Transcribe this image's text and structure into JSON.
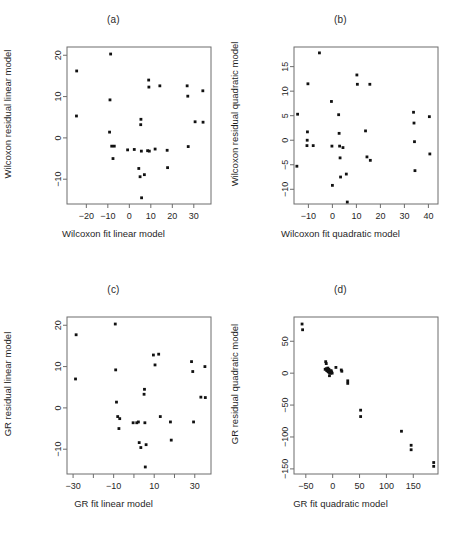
{
  "figure": {
    "background": "#ffffff",
    "point_color": "#111111",
    "axis_color": "#6d6d6d",
    "panel_count": 4
  },
  "chart_data": [
    {
      "type": "scatter",
      "panel": "(a)",
      "title": "",
      "xlabel": "Wilcoxon fit linear model",
      "ylabel": "Wilcoxon residual linear model",
      "xlim": [
        -29,
        38
      ],
      "ylim": [
        -16,
        22
      ],
      "xticks": [
        -20,
        -10,
        0,
        10,
        20,
        30
      ],
      "yticks": [
        -10,
        0,
        10,
        20
      ],
      "grid": false,
      "legend": "none",
      "points": [
        [
          -24.5,
          16.2
        ],
        [
          -24.6,
          5.3
        ],
        [
          -8.7,
          20.3
        ],
        [
          -9.0,
          9.2
        ],
        [
          -9.2,
          1.4
        ],
        [
          -8.2,
          -2.0
        ],
        [
          -7.0,
          -2.0
        ],
        [
          -7.6,
          -5.0
        ],
        [
          -0.8,
          -2.9
        ],
        [
          2.3,
          -2.8
        ],
        [
          4.4,
          -7.4
        ],
        [
          5.0,
          -9.4
        ],
        [
          5.3,
          3.2
        ],
        [
          5.4,
          4.5
        ],
        [
          5.6,
          -3.2
        ],
        [
          5.7,
          -14.5
        ],
        [
          7.0,
          -8.9
        ],
        [
          8.5,
          -3.1
        ],
        [
          9.0,
          14.0
        ],
        [
          9.1,
          12.3
        ],
        [
          9.3,
          -3.2
        ],
        [
          12.0,
          -2.7
        ],
        [
          14.2,
          12.6
        ],
        [
          17.6,
          -3.0
        ],
        [
          17.8,
          -7.2
        ],
        [
          26.9,
          12.6
        ],
        [
          27.2,
          10.1
        ],
        [
          27.4,
          -2.1
        ],
        [
          30.6,
          3.9
        ],
        [
          34.2,
          11.4
        ],
        [
          34.3,
          3.8
        ]
      ]
    },
    {
      "type": "scatter",
      "panel": "(b)",
      "title": "",
      "xlabel": "Wilcoxon fit quadratic model",
      "ylabel": "Wilcoxon residual quadratic model",
      "xlim": [
        -16,
        44
      ],
      "ylim": [
        -13,
        19
      ],
      "xticks": [
        -10,
        0,
        10,
        20,
        30,
        40
      ],
      "yticks": [
        -10,
        -5,
        0,
        5,
        10,
        15
      ],
      "grid": false,
      "legend": "none",
      "points": [
        [
          -14.5,
          5.3
        ],
        [
          -14.8,
          -5.3
        ],
        [
          -10.2,
          11.5
        ],
        [
          -10.4,
          1.7
        ],
        [
          -10.5,
          0.0
        ],
        [
          -10.6,
          -1.1
        ],
        [
          -8.0,
          -1.1
        ],
        [
          -5.4,
          17.8
        ],
        [
          -0.4,
          7.9
        ],
        [
          -0.2,
          -1.2
        ],
        [
          0.0,
          -9.2
        ],
        [
          2.6,
          5.2
        ],
        [
          2.8,
          1.4
        ],
        [
          3.0,
          -1.2
        ],
        [
          3.2,
          -3.6
        ],
        [
          3.4,
          -7.5
        ],
        [
          4.4,
          -1.5
        ],
        [
          5.8,
          -6.9
        ],
        [
          6.2,
          -12.6
        ],
        [
          10.2,
          13.3
        ],
        [
          10.4,
          11.4
        ],
        [
          13.8,
          1.9
        ],
        [
          14.4,
          -3.4
        ],
        [
          15.6,
          11.4
        ],
        [
          15.8,
          -4.1
        ],
        [
          33.8,
          5.7
        ],
        [
          34.0,
          3.5
        ],
        [
          34.2,
          -0.3
        ],
        [
          34.4,
          -6.2
        ],
        [
          40.4,
          4.8
        ],
        [
          40.6,
          -2.8
        ]
      ]
    },
    {
      "type": "scatter",
      "panel": "(c)",
      "title": "",
      "xlabel": "GR fit linear model",
      "ylabel": "GR residual linear model",
      "xlim": [
        -33,
        38
      ],
      "ylim": [
        -16,
        22
      ],
      "xticks": [
        -30,
        -10,
        10,
        30
      ],
      "yticks": [
        -10,
        0,
        10,
        20
      ],
      "grid": false,
      "legend": "none",
      "points": [
        [
          -28.5,
          17.7
        ],
        [
          -28.8,
          7.0
        ],
        [
          -9.2,
          20.3
        ],
        [
          -9.0,
          9.2
        ],
        [
          -8.6,
          1.4
        ],
        [
          -8.0,
          -2.1
        ],
        [
          -7.0,
          -2.6
        ],
        [
          -7.4,
          -5.0
        ],
        [
          -0.4,
          -3.6
        ],
        [
          1.4,
          -3.6
        ],
        [
          2.2,
          -3.4
        ],
        [
          2.6,
          -8.4
        ],
        [
          3.4,
          -9.6
        ],
        [
          5.0,
          3.3
        ],
        [
          5.2,
          4.5
        ],
        [
          5.4,
          -3.6
        ],
        [
          5.6,
          -14.3
        ],
        [
          6.0,
          -8.9
        ],
        [
          9.6,
          12.8
        ],
        [
          12.2,
          13.0
        ],
        [
          10.4,
          10.4
        ],
        [
          13.0,
          -2.1
        ],
        [
          18.0,
          -3.4
        ],
        [
          18.4,
          -7.8
        ],
        [
          28.4,
          11.2
        ],
        [
          29.0,
          8.8
        ],
        [
          29.4,
          -3.4
        ],
        [
          33.0,
          2.6
        ],
        [
          35.0,
          10.0
        ],
        [
          35.2,
          2.5
        ]
      ]
    },
    {
      "type": "scatter",
      "panel": "(d)",
      "title": "",
      "xlabel": "GR fit quadratic model",
      "ylabel": "GR residual quadratic model",
      "xlim": [
        -72,
        196
      ],
      "ylim": [
        -158,
        88
      ],
      "xticks": [
        -50,
        0,
        50,
        100,
        150
      ],
      "yticks": [
        -150,
        -100,
        -50,
        0,
        50
      ],
      "grid": false,
      "legend": "none",
      "points": [
        [
          -57,
          77
        ],
        [
          -56,
          68
        ],
        [
          -13,
          18
        ],
        [
          -12,
          15
        ],
        [
          -14,
          6
        ],
        [
          -12,
          7
        ],
        [
          -11,
          4
        ],
        [
          -10,
          5
        ],
        [
          -9,
          3
        ],
        [
          -8,
          2
        ],
        [
          -9,
          8
        ],
        [
          -7,
          6
        ],
        [
          -6,
          1
        ],
        [
          -5,
          3
        ],
        [
          -4,
          0
        ],
        [
          -6,
          -4
        ],
        [
          -3,
          4
        ],
        [
          -2,
          2
        ],
        [
          -1,
          0
        ],
        [
          6,
          9
        ],
        [
          16,
          5
        ],
        [
          17,
          3
        ],
        [
          28,
          -12
        ],
        [
          28,
          -16
        ],
        [
          52,
          -58
        ],
        [
          52,
          -68
        ],
        [
          128,
          -91
        ],
        [
          146,
          -113
        ],
        [
          146,
          -120
        ],
        [
          188,
          -140
        ],
        [
          188,
          -146
        ]
      ]
    }
  ]
}
